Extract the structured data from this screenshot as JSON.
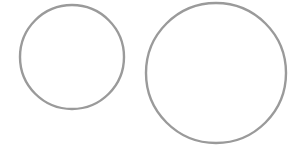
{
  "canvas": {
    "width": 293,
    "height": 145,
    "background": "#ffffff"
  },
  "style": {
    "stroke": "#9a9a9a",
    "stroke_width": 2.4,
    "fill": "none"
  },
  "shapes": [
    {
      "id": "circle-small",
      "type": "circle",
      "cx": 72,
      "cy": 57,
      "r": 52
    },
    {
      "id": "circle-large",
      "type": "circle",
      "cx": 216,
      "cy": 73,
      "r": 70
    }
  ]
}
